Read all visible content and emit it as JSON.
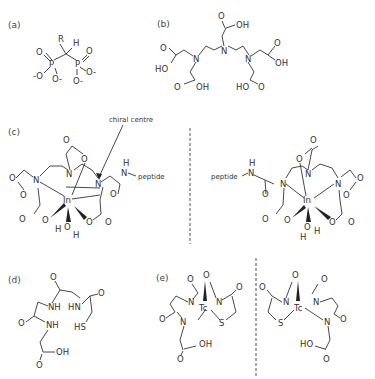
{
  "panels": {
    "a": {
      "label": "(a)",
      "atoms": [
        "R",
        "H",
        "P",
        "P",
        "O",
        "O",
        "-O",
        "O-",
        "O-",
        "O-"
      ]
    },
    "b": {
      "label": "(b)",
      "atoms": [
        "N",
        "N",
        "N",
        "OH",
        "HO",
        "OH",
        "HO",
        "OH",
        "O",
        "O",
        "O",
        "O",
        "O"
      ]
    },
    "c": {
      "label": "(c)",
      "annotation": "chiral centre",
      "metal": "In",
      "substituent": "peptide",
      "water": "H O H",
      "mirror_substituent": "peptide"
    },
    "d": {
      "label": "(d)",
      "atoms": [
        "NH",
        "HN",
        "NH",
        "HS",
        "OH",
        "O",
        "O",
        "O",
        "O"
      ]
    },
    "e": {
      "label": "(e)",
      "metal": "Tc",
      "atoms": [
        "N",
        "N",
        "N",
        "S",
        "OH",
        "HO"
      ]
    }
  },
  "colors": {
    "ink": "#333333",
    "divider": "#555555",
    "background": "#ffffff"
  }
}
